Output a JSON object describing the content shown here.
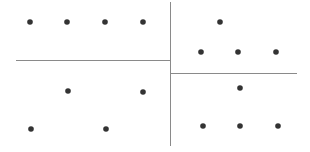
{
  "diagram": {
    "width": 310,
    "height": 152,
    "colors": {
      "background": "#ffffff",
      "line": "#8a8a8a",
      "dot": "#333333"
    },
    "dot_radius": 2.8,
    "lines": [
      {
        "id": "vertical-divider",
        "x1": 170.5,
        "y1": 2,
        "x2": 170.5,
        "y2": 146
      },
      {
        "id": "left-horizontal-divider",
        "x1": 16,
        "y1": 60.5,
        "x2": 170.5,
        "y2": 60.5
      },
      {
        "id": "right-horizontal-divider",
        "x1": 170.5,
        "y1": 73.5,
        "x2": 297,
        "y2": 73.5
      }
    ],
    "regions": [
      {
        "id": "top-left",
        "dots": [
          [
            30,
            22
          ],
          [
            67,
            22
          ],
          [
            105,
            22
          ],
          [
            143,
            22
          ]
        ]
      },
      {
        "id": "bottom-left",
        "dots": [
          [
            68,
            91
          ],
          [
            143,
            92
          ],
          [
            31,
            129
          ],
          [
            106,
            129
          ]
        ]
      },
      {
        "id": "top-right",
        "dots": [
          [
            220,
            22
          ],
          [
            201,
            52
          ],
          [
            238,
            52
          ],
          [
            276,
            52
          ]
        ]
      },
      {
        "id": "bottom-right",
        "dots": [
          [
            240,
            88
          ],
          [
            203,
            126
          ],
          [
            240,
            126
          ],
          [
            278,
            126
          ]
        ]
      }
    ]
  }
}
